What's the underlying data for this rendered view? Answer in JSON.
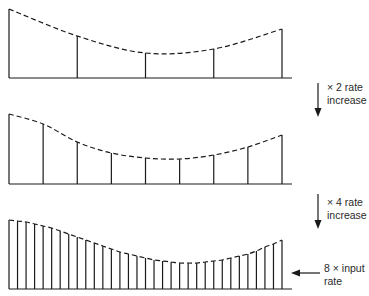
{
  "diagram": {
    "stroke_color": "#1a1a1a",
    "background": "#ffffff",
    "x_start": 9,
    "x_end": 282,
    "baseline_extend_to": 292,
    "panels": [
      {
        "name": "input-samples",
        "baseline_y": 78,
        "sample_count": 5,
        "heights_px": [
          69,
          42,
          25,
          29,
          49
        ]
      },
      {
        "name": "x2-rate-samples",
        "baseline_y": 184,
        "sample_count": 9,
        "heights_px": [
          70,
          60,
          42,
          31,
          26,
          25,
          29,
          37,
          49
        ]
      },
      {
        "name": "x8-rate-samples",
        "baseline_y": 289,
        "sample_count": 33,
        "heights_px": [
          69,
          68,
          67,
          65,
          63,
          61,
          58,
          55,
          52,
          49,
          46,
          43,
          40,
          37,
          35,
          33,
          31,
          29,
          28,
          27,
          26,
          26,
          26,
          27,
          28,
          29,
          31,
          33,
          35,
          38,
          42,
          45,
          49
        ]
      }
    ]
  },
  "annotations": {
    "arrow1": {
      "line1": "× 2 rate",
      "line2": "increase"
    },
    "arrow2": {
      "line1": "× 4 rate",
      "line2": "increase"
    },
    "arrow3": {
      "line1": "8 × input",
      "line2": "rate"
    }
  }
}
